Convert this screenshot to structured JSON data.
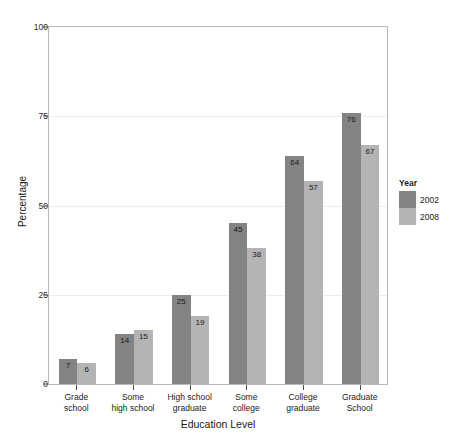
{
  "chart_data": {
    "type": "bar",
    "title": "",
    "xlabel": "Education Level",
    "ylabel": "Percentage",
    "categories": [
      "Grade\nschool",
      "Some\nhigh school",
      "High school\ngraduate",
      "Some\ncollege",
      "College\ngraduate",
      "Graduate\nSchool"
    ],
    "series": [
      {
        "name": "2002",
        "color": "#838383",
        "values": [
          7,
          14,
          25,
          45,
          64,
          76
        ]
      },
      {
        "name": "2008",
        "color": "#b4b4b4",
        "values": [
          6,
          15,
          19,
          38,
          57,
          67
        ]
      }
    ],
    "ylim": [
      0,
      100
    ],
    "yticks": [
      0,
      25,
      50,
      75,
      100
    ],
    "ytick_labels": [
      "0",
      "25",
      "50",
      "75",
      "100"
    ],
    "grid": true,
    "legend": {
      "title": "Year",
      "position": "right",
      "entries": [
        "2002",
        "2008"
      ]
    },
    "data_labels": true
  },
  "legend": {
    "title": "Year",
    "entries": [
      {
        "label": "2002"
      },
      {
        "label": "2008"
      }
    ]
  },
  "axes": {
    "x_title": "Education Level",
    "y_title": "Percentage"
  }
}
